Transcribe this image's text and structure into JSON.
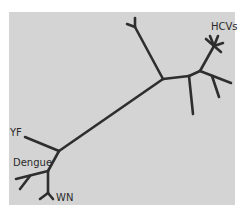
{
  "diagram": {
    "type": "unrooted phylogenetic tree",
    "background_color": "#d4d4d4",
    "branch_color": "#2e2e2e",
    "labels": {
      "hcv": "HCVs",
      "yf": "YF",
      "dengue": "Dengue",
      "wn": "WN"
    }
  }
}
